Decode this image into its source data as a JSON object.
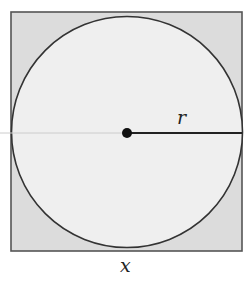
{
  "diagram": {
    "square": {
      "x": 11,
      "y": 12,
      "size": 231,
      "fill": "#dcdcdc",
      "stroke": "#444444"
    },
    "circle": {
      "cx": 127,
      "cy": 133,
      "r": 116,
      "fill": "#efefef",
      "stroke": "#333333"
    },
    "center_point": {
      "cx": 127,
      "cy": 133,
      "r": 5,
      "fill": "#111111"
    },
    "radius_line": {
      "x1": 127,
      "y1": 133,
      "x2": 242,
      "y2": 133,
      "stroke": "#222222"
    },
    "diameter_guide": {
      "x1": 0,
      "y1": 133,
      "x2": 127,
      "y2": 133,
      "stroke": "#c8c8c8"
    },
    "labels": {
      "radius": "r",
      "side": "x"
    }
  }
}
